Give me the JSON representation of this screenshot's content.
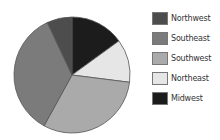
{
  "chart_data": {
    "type": "pie",
    "title": "",
    "start_angle_deg": 0,
    "direction": "clockwise",
    "slices": [
      {
        "label": "Midwest",
        "value": 15,
        "color": "#1c1c1c"
      },
      {
        "label": "Northeast",
        "value": 12,
        "color": "#e6e6e6"
      },
      {
        "label": "Southwest",
        "value": 31,
        "color": "#aaaaaa"
      },
      {
        "label": "Southeast",
        "value": 35,
        "color": "#7b7b7b"
      },
      {
        "label": "Northwest",
        "value": 7,
        "color": "#4d4d4d"
      }
    ],
    "legend": {
      "position": "right",
      "entries": [
        {
          "label": "Northwest",
          "color": "#4d4d4d"
        },
        {
          "label": "Southeast",
          "color": "#7b7b7b"
        },
        {
          "label": "Southwest",
          "color": "#aaaaaa"
        },
        {
          "label": "Northeast",
          "color": "#e6e6e6"
        },
        {
          "label": "Midwest",
          "color": "#1c1c1c"
        }
      ]
    }
  }
}
